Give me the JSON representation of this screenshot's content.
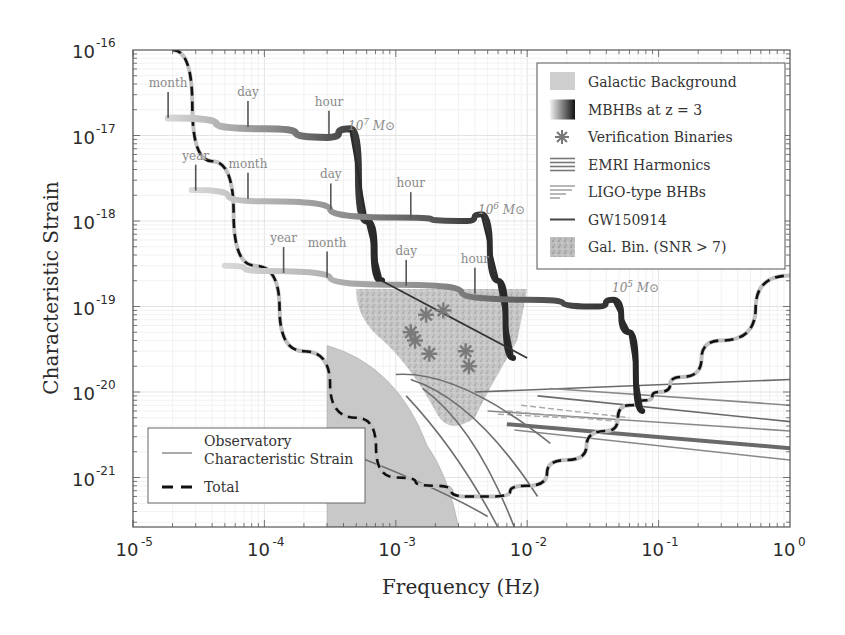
{
  "chart_data": {
    "type": "line",
    "title": "",
    "xlabel": "Frequency (Hz)",
    "ylabel": "Characteristic Strain",
    "xscale": "log",
    "yscale": "log",
    "xlim": [
      1e-05,
      1
    ],
    "ylim": [
      2.6e-22,
      1e-16
    ],
    "grid": true,
    "x_ticks": [
      {
        "base": "10",
        "exp": "-5",
        "value": 1e-05
      },
      {
        "base": "10",
        "exp": "-4",
        "value": 0.0001
      },
      {
        "base": "10",
        "exp": "-3",
        "value": 0.001
      },
      {
        "base": "10",
        "exp": "-2",
        "value": 0.01
      },
      {
        "base": "10",
        "exp": "-1",
        "value": 0.1
      },
      {
        "base": "10",
        "exp": "0",
        "value": 1
      }
    ],
    "y_ticks": [
      {
        "base": "10",
        "exp": "-16",
        "value": 1e-16
      },
      {
        "base": "10",
        "exp": "-17",
        "value": 1e-17
      },
      {
        "base": "10",
        "exp": "-18",
        "value": 1e-18
      },
      {
        "base": "10",
        "exp": "-19",
        "value": 1e-19
      },
      {
        "base": "10",
        "exp": "-20",
        "value": 1e-20
      },
      {
        "base": "10",
        "exp": "-21",
        "value": 1e-21
      }
    ],
    "legend_upper_right": [
      {
        "label": "Galactic Background",
        "symbol": "patch-gray"
      },
      {
        "label": "MBHBs at z = 3",
        "symbol": "gradient-bar"
      },
      {
        "label": "Verification Binaries",
        "symbol": "asterisk"
      },
      {
        "label": "EMRI Harmonics",
        "symbol": "multi-line"
      },
      {
        "label": "LIGO-type BHBs",
        "symbol": "tapered-lines"
      },
      {
        "label": "GW150914",
        "symbol": "line"
      },
      {
        "label": "Gal. Bin. (SNR > 7)",
        "symbol": "speckle-patch"
      }
    ],
    "legend_lower_left": [
      {
        "label_line1": "Observatory",
        "label_line2": "Characteristic Strain",
        "symbol": "gray-line"
      },
      {
        "label_line1": "Total",
        "label_line2": "",
        "symbol": "dashed-black"
      }
    ],
    "series": [
      {
        "name": "Total",
        "style": "dashed-black",
        "x": [
          2e-05,
          4e-05,
          8.5e-05,
          0.0002,
          0.0005,
          0.001,
          0.002,
          0.0035,
          0.0055,
          0.01,
          0.02,
          0.04,
          0.06,
          0.08,
          0.1,
          0.15,
          0.3,
          1.0
        ],
        "y": [
          1e-16,
          5e-18,
          3e-19,
          3e-20,
          5e-21,
          1e-21,
          8e-22,
          6e-22,
          6e-22,
          8e-22,
          1.6e-21,
          3.5e-21,
          7e-21,
          8e-21,
          1e-20,
          1.5e-20,
          4e-20,
          2.3e-19
        ]
      },
      {
        "name": "MBHB 10^7 Msun",
        "label": "10^7 M_sun",
        "x": [
          1.85e-05,
          0.0001,
          0.0003,
          0.00045,
          0.0006,
          0.00078
        ],
        "y": [
          1.6e-17,
          1.2e-17,
          9.5e-18,
          1.2e-17,
          1e-18,
          2e-19
        ],
        "time_markers": [
          {
            "label": "month",
            "f": 1.85e-05
          },
          {
            "label": "day",
            "f": 7.5e-05
          },
          {
            "label": "hour",
            "f": 0.00031
          }
        ]
      },
      {
        "name": "MBHB 10^6 Msun",
        "label": "10^6 M_sun",
        "x": [
          2.8e-05,
          0.0001,
          0.001,
          0.0035,
          0.0045,
          0.006,
          0.0078
        ],
        "y": [
          2.3e-18,
          1.7e-18,
          1.1e-18,
          1e-18,
          1.2e-18,
          2e-19,
          2.5e-20
        ],
        "time_markers": [
          {
            "label": "year",
            "f": 3e-05
          },
          {
            "label": "month",
            "f": 7.5e-05
          },
          {
            "label": "day",
            "f": 0.00032
          },
          {
            "label": "hour",
            "f": 0.0013
          }
        ]
      },
      {
        "name": "MBHB 10^5 Msun",
        "label": "10^5 M_sun",
        "x": [
          5e-05,
          0.0001,
          0.001,
          0.01,
          0.035,
          0.045,
          0.06,
          0.075
        ],
        "y": [
          3e-19,
          2.6e-19,
          1.8e-19,
          1.2e-19,
          1e-19,
          1.2e-19,
          5e-20,
          6e-21
        ],
        "time_markers": [
          {
            "label": "year",
            "f": 0.00014
          },
          {
            "label": "month",
            "f": 0.0003
          },
          {
            "label": "day",
            "f": 0.0012
          },
          {
            "label": "hour",
            "f": 0.004
          }
        ]
      },
      {
        "name": "Verification Binaries",
        "style": "asterisk",
        "x": [
          0.0013,
          0.0014,
          0.0017,
          0.0018,
          0.0023,
          0.0034,
          0.0036
        ],
        "y": [
          5e-20,
          4e-20,
          8e-20,
          2.8e-20,
          9e-20,
          3e-20,
          2e-20
        ]
      },
      {
        "name": "GW150914",
        "style": "line",
        "x": [
          0.00078,
          0.01
        ],
        "y": [
          2e-19,
          2.5e-20
        ]
      }
    ],
    "regions": [
      {
        "name": "Galactic Background",
        "x_range": [
          0.0003,
          0.003
        ],
        "y_top": 3.5e-20
      },
      {
        "name": "Gal. Bin. (SNR > 7)",
        "x_range": [
          0.0005,
          0.01
        ],
        "y_range": [
          4e-21,
          2e-19
        ]
      }
    ]
  }
}
